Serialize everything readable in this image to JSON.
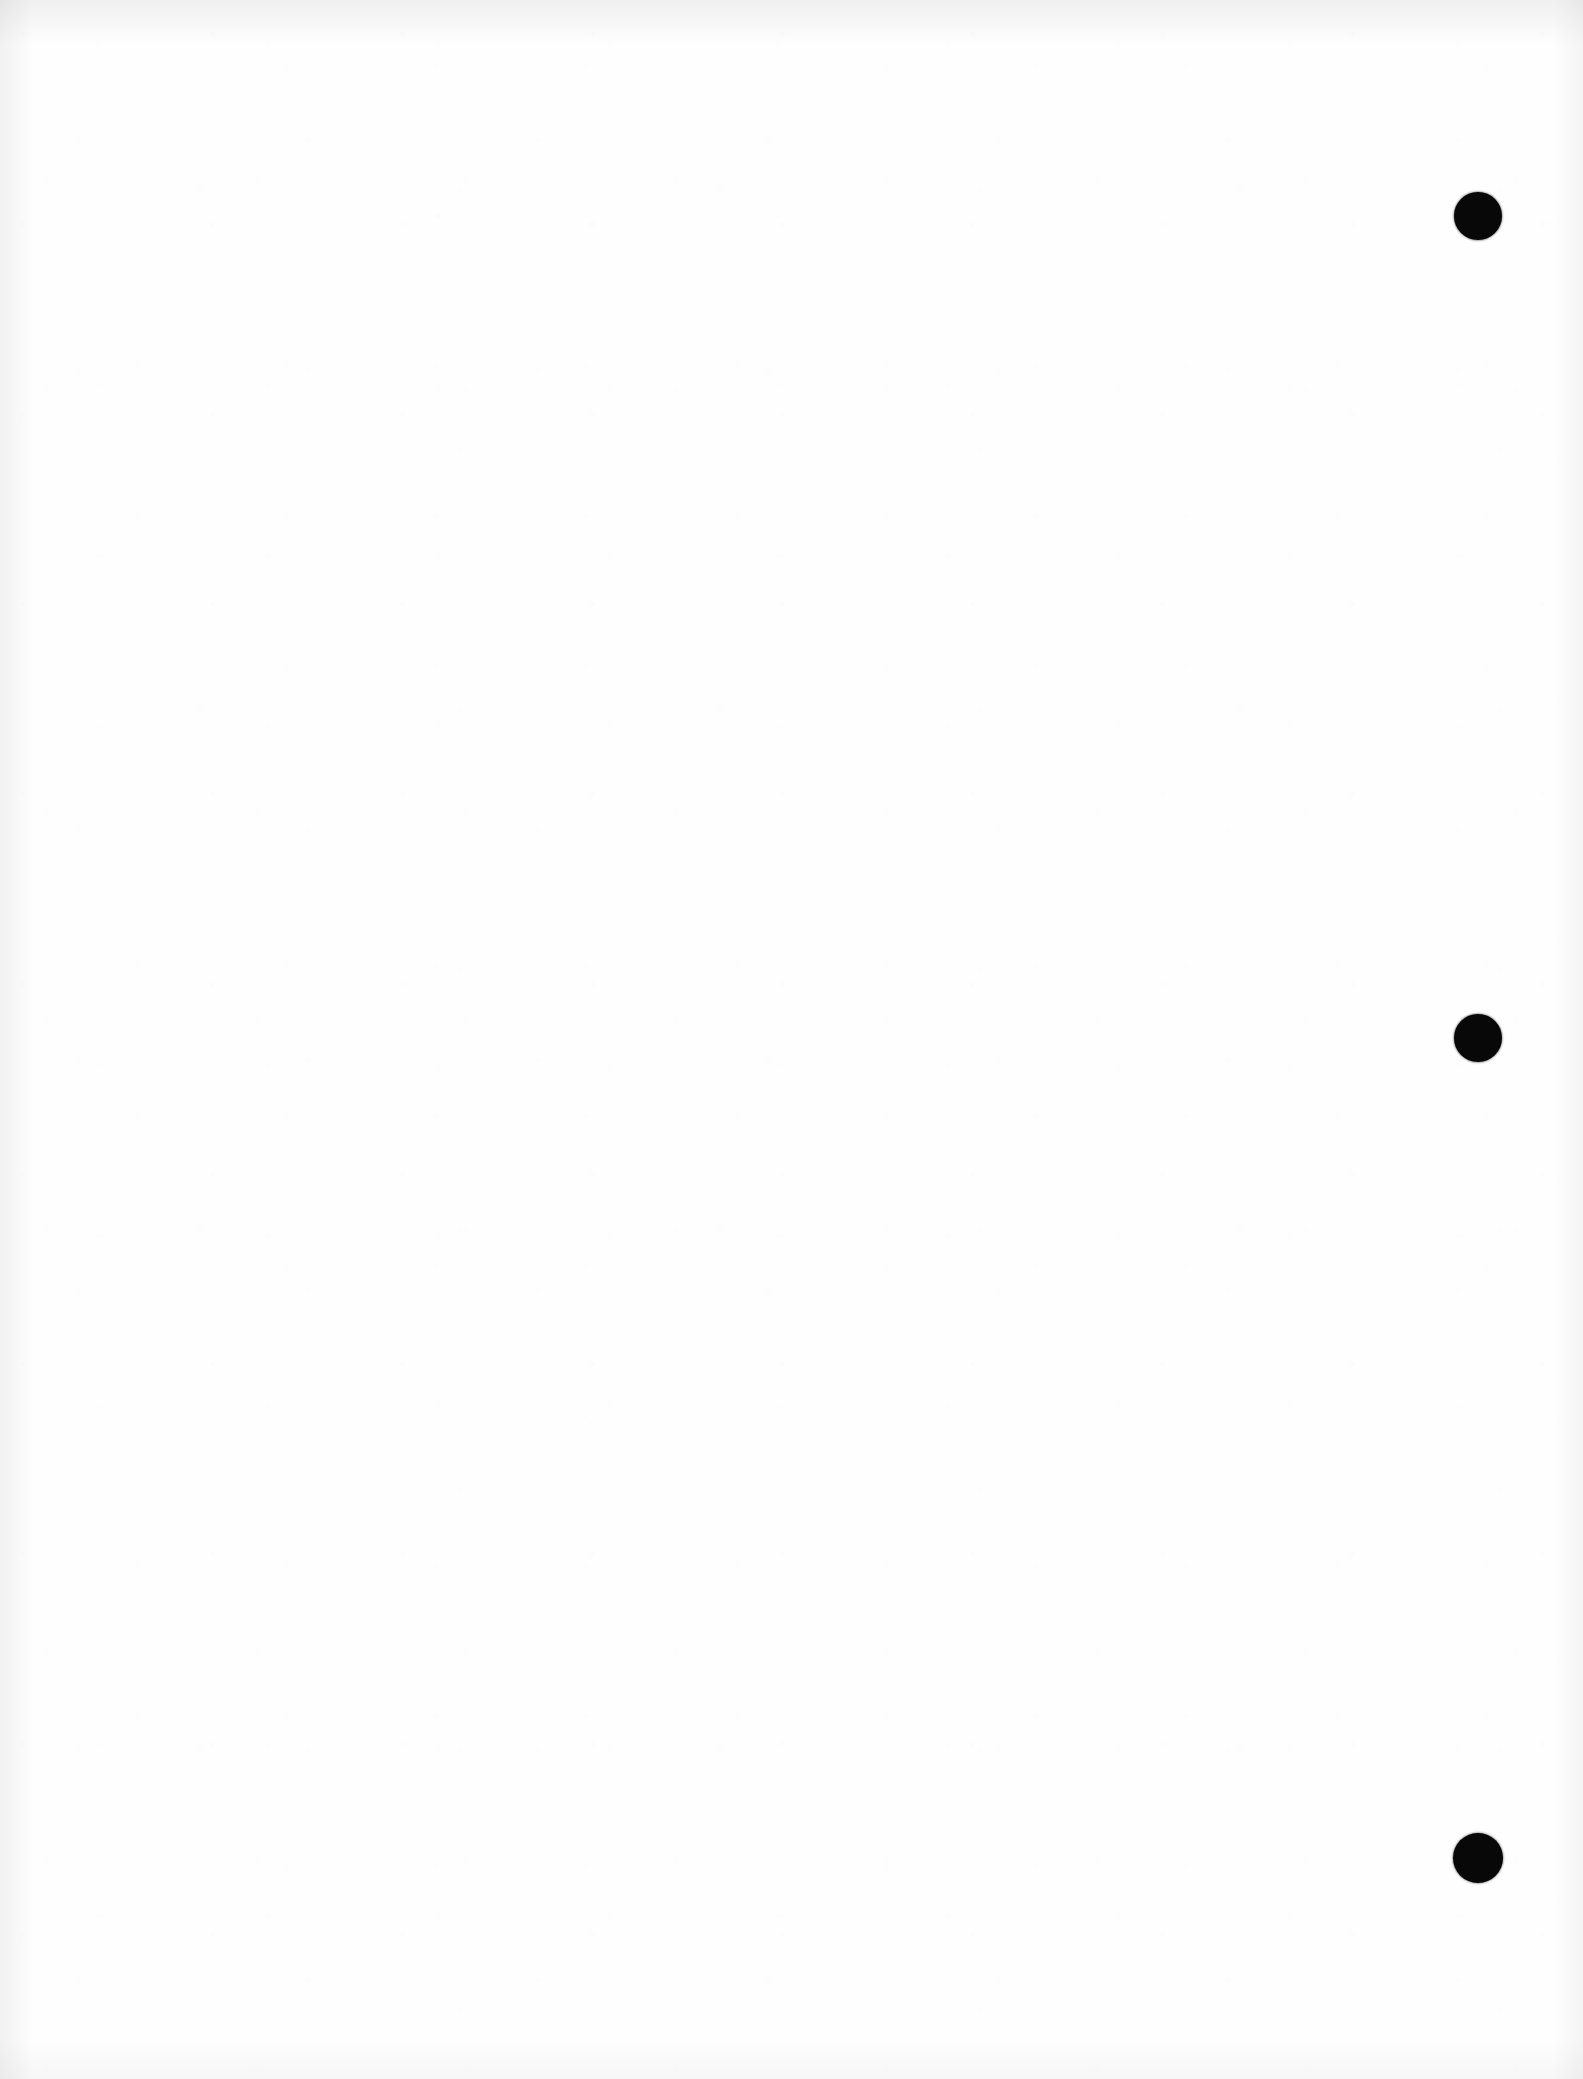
{
  "page": {
    "kind": "scanned-document-page",
    "orientation": "portrait",
    "width_px": 1583,
    "height_px": 2079,
    "background_color": "#fefefe",
    "paper_color": "#ffffff",
    "content_text": "",
    "is_blank": true
  },
  "marks": {
    "ink_color": "#080808",
    "punch_holes": [
      {
        "name": "punch-hole-top",
        "cx": 1478,
        "cy": 216,
        "d": 48
      },
      {
        "name": "punch-hole-middle",
        "cx": 1478,
        "cy": 1038,
        "d": 48
      },
      {
        "name": "punch-hole-bottom",
        "cx": 1478,
        "cy": 1858,
        "d": 50
      }
    ]
  },
  "scan_artifacts": {
    "top_edge_shadow": "#000000",
    "left_edge_shadow": "#000000",
    "right_edge_shadow": "#000000",
    "bottom_edge_shadow": "#000000"
  }
}
